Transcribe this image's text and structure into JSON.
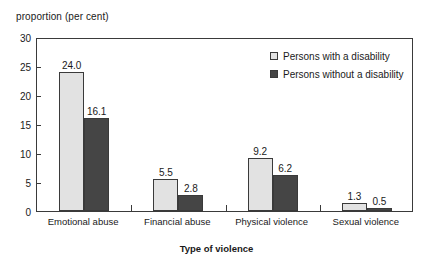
{
  "chart_data": {
    "type": "bar",
    "title": "",
    "xlabel": "Type of violence",
    "ylabel": "proportion (per cent)",
    "ylim": [
      0,
      30
    ],
    "yticks": [
      0,
      5,
      10,
      15,
      20,
      25,
      30
    ],
    "ytick_labels": [
      "0",
      "5",
      "10",
      "15",
      "20",
      "25",
      "30"
    ],
    "grid": false,
    "legend_position": "top-right",
    "categories": [
      "Emotional abuse",
      "Financial abuse",
      "Physical violence",
      "Sexual violence"
    ],
    "series": [
      {
        "name": "Persons with a disability",
        "color": "#e2e2e2",
        "values": [
          24.0,
          5.5,
          9.2,
          1.3
        ],
        "value_labels": [
          "24.0",
          "5.5",
          "9.2",
          "1.3"
        ]
      },
      {
        "name": "Persons without a disability",
        "color": "#454545",
        "values": [
          16.1,
          2.8,
          6.2,
          0.5
        ],
        "value_labels": [
          "16.1",
          "2.8",
          "6.2",
          "0.5"
        ]
      }
    ]
  },
  "axis": {
    "y_title": "proportion (per cent)",
    "x_title": "Type of violence"
  },
  "legend": {
    "items": [
      {
        "label": "Persons with a disability",
        "swatch": "light"
      },
      {
        "label": "Persons without a disability",
        "swatch": "dark"
      }
    ]
  }
}
